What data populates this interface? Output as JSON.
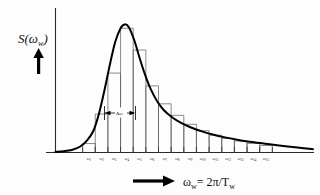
{
  "figure": {
    "y_axis_label_main": "S(",
    "y_axis_label_var": "ω",
    "y_axis_label_sub": "w",
    "y_axis_label_close": ")",
    "x_axis_label_var": "ω",
    "x_axis_label_sub": "w",
    "x_axis_label_rest": "= 2π/T",
    "x_axis_label_rest_sub": "w",
    "band_annotation": "Δω",
    "y_arrow_name": "up-arrow",
    "x_arrow_name": "right-arrow"
  },
  "chart_data": {
    "type": "bar",
    "xlabel": "ωw = 2π/Tw",
    "ylabel": "S(ωw)",
    "grid": false,
    "legend": null,
    "annotations": [
      {
        "text": "Δω",
        "meaning": "constant frequency band width",
        "x_center": 6.0,
        "y": 0.3
      }
    ],
    "axis_style": "arrows only, no numeric scale",
    "xlim": [
      0,
      19
    ],
    "ylim": [
      0,
      1.05
    ],
    "categories": [
      "ω1",
      "ω2",
      "ω3",
      "ω4",
      "ω5",
      "ω6",
      "ω7",
      "ω8",
      "ω9",
      "ω10",
      "ω11",
      "ω12",
      "ω13",
      "ω14",
      "ω15"
    ],
    "tick_labels": [
      {
        "base": "ω",
        "sub": "1"
      },
      {
        "base": "ω",
        "sub": "2"
      },
      {
        "base": "ω",
        "sub": "3"
      },
      {
        "base": "ω",
        "sub": "4"
      },
      {
        "base": "ω",
        "sub": "5"
      },
      {
        "base": "ω",
        "sub": "6"
      },
      {
        "base": "ω",
        "sub": "7"
      },
      {
        "base": "ω",
        "sub": "8"
      },
      {
        "base": "ω",
        "sub": "9"
      },
      {
        "base": "ω",
        "sub": "10"
      },
      {
        "base": "ω",
        "sub": "11"
      },
      {
        "base": "ω",
        "sub": "12"
      },
      {
        "base": "ω",
        "sub": "13"
      },
      {
        "base": "ω",
        "sub": "14"
      },
      {
        "base": "ω",
        "sub": "15"
      }
    ],
    "values": [
      0.07,
      0.3,
      0.62,
      0.97,
      0.8,
      0.52,
      0.38,
      0.29,
      0.22,
      0.17,
      0.135,
      0.11,
      0.09,
      0.07,
      0.055
    ],
    "curve_label": "continuous spectrum S(ωw)",
    "curve_points": [
      [
        0.0,
        0.005
      ],
      [
        0.6,
        0.01
      ],
      [
        1.2,
        0.02
      ],
      [
        1.8,
        0.045
      ],
      [
        2.3,
        0.09
      ],
      [
        2.8,
        0.17
      ],
      [
        3.2,
        0.3
      ],
      [
        3.6,
        0.48
      ],
      [
        4.0,
        0.68
      ],
      [
        4.4,
        0.86
      ],
      [
        4.8,
        0.97
      ],
      [
        5.1,
        1.0
      ],
      [
        5.4,
        0.98
      ],
      [
        5.8,
        0.88
      ],
      [
        6.2,
        0.74
      ],
      [
        6.6,
        0.61
      ],
      [
        7.0,
        0.5
      ],
      [
        7.5,
        0.4
      ],
      [
        8.0,
        0.33
      ],
      [
        8.6,
        0.275
      ],
      [
        9.2,
        0.235
      ],
      [
        10.0,
        0.195
      ],
      [
        10.8,
        0.165
      ],
      [
        11.6,
        0.14
      ],
      [
        12.5,
        0.118
      ],
      [
        13.5,
        0.098
      ],
      [
        14.5,
        0.082
      ],
      [
        15.5,
        0.068
      ],
      [
        16.5,
        0.055
      ],
      [
        17.5,
        0.043
      ],
      [
        18.5,
        0.032
      ],
      [
        19.0,
        0.026
      ]
    ]
  },
  "colors": {
    "curve": "#000000",
    "bars": "#5a5a5a",
    "axis": "#2a2a2a",
    "text": "#111111",
    "background": "#fdfdfd"
  }
}
